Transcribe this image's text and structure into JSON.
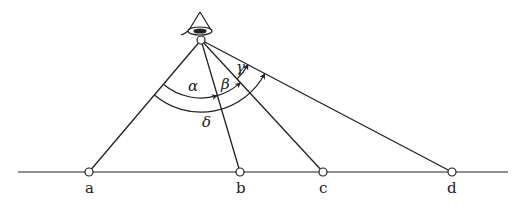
{
  "diagram": {
    "type": "geometric-optics-angles",
    "observer": {
      "icon": "eye-icon",
      "x": 201,
      "y": 40
    },
    "baseline": {
      "x1": 18,
      "x2": 508,
      "y": 172
    },
    "points": [
      {
        "id": "a",
        "label": "a",
        "x": 89,
        "y": 172
      },
      {
        "id": "b",
        "label": "b",
        "x": 240,
        "y": 172
      },
      {
        "id": "c",
        "label": "c",
        "x": 323,
        "y": 172
      },
      {
        "id": "d",
        "label": "d",
        "x": 452,
        "y": 172
      }
    ],
    "angles": [
      {
        "label": "α",
        "from": "a",
        "to": "b",
        "radius": 58
      },
      {
        "label": "β",
        "from": "b",
        "to": "c",
        "radius": 58
      },
      {
        "label": "γ",
        "from": "c",
        "to": "d",
        "radius": 53
      },
      {
        "label": "δ",
        "from": "a",
        "to": "d",
        "radius": 72
      }
    ],
    "colors": {
      "stroke": "#222222",
      "background": "#ffffff"
    }
  }
}
